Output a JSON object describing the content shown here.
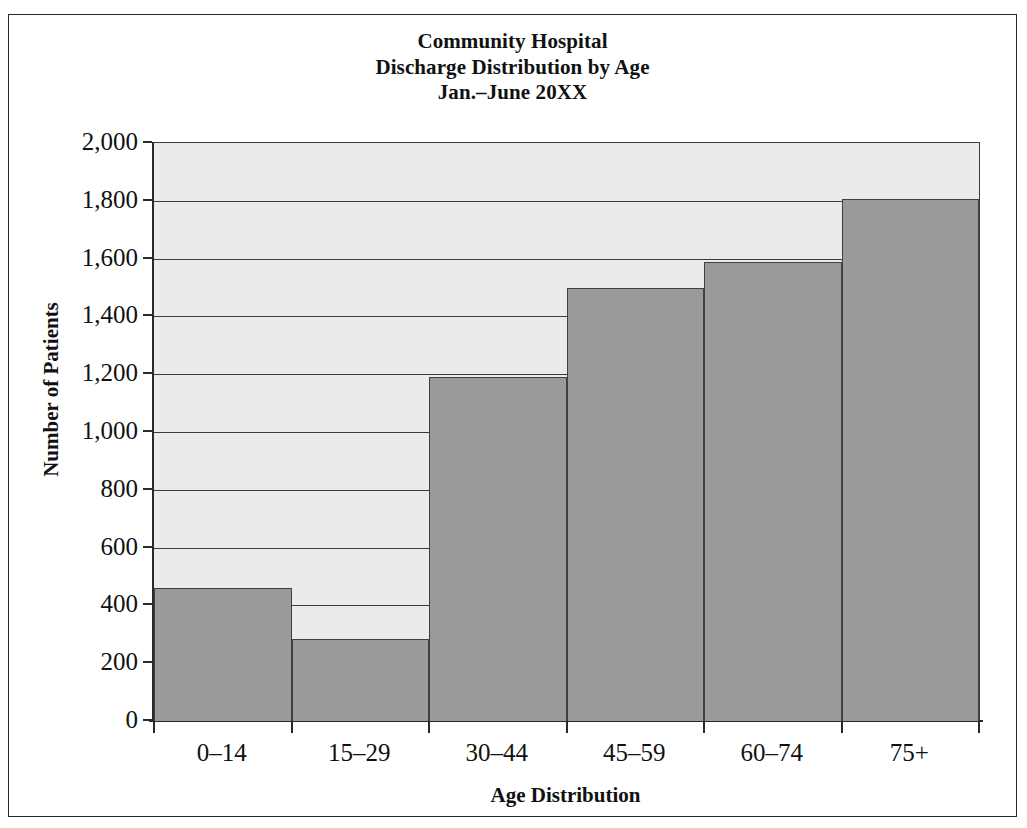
{
  "figure": {
    "background_color": "#ffffff",
    "frame_color": "#2a2a2a"
  },
  "chart_data": {
    "type": "bar",
    "title": "Community Hospital\nDischarge Distribution by Age\nJan.–June 20XX",
    "title_lines": [
      "Community Hospital",
      "Discharge Distribution by Age",
      "Jan.–June 20XX"
    ],
    "xlabel": "Age Distribution",
    "ylabel": "Number of Patients",
    "categories": [
      "0–14",
      "15–29",
      "30–44",
      "45–59",
      "60–74",
      "75+"
    ],
    "values": [
      460,
      285,
      1190,
      1500,
      1590,
      1805
    ],
    "ylim": [
      0,
      2000
    ],
    "ytick_step": 200,
    "ytick_labels": [
      "2,000",
      "1,800",
      "1,600",
      "1,400",
      "1,200",
      "1,000",
      "800",
      "600",
      "400",
      "200",
      "0"
    ],
    "ytick_values": [
      2000,
      1800,
      1600,
      1400,
      1200,
      1000,
      800,
      600,
      400,
      200,
      0
    ],
    "grid": true,
    "legend": null,
    "bar_fill_color": "#9a9a9a",
    "bar_edge_color": "#404040",
    "plot_background_color": "#ebebeb",
    "bar_gap": 0
  }
}
